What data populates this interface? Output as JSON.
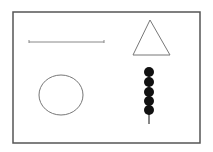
{
  "canvas": {
    "width": 213,
    "height": 152,
    "background": "#ffffff"
  },
  "frame": {
    "x": 13,
    "y": 12,
    "width": 187,
    "height": 131,
    "stroke": "#555555",
    "stroke_width": 1.5
  },
  "shapes": {
    "line": {
      "x1": 29,
      "y1": 42,
      "x2": 104,
      "y2": 42,
      "tick_height": 3,
      "stroke": "#888888"
    },
    "triangle": {
      "points": "143,20 133,55 170,55",
      "stroke": "#777777"
    },
    "circle": {
      "cx": 61,
      "cy": 95,
      "rx": 22,
      "ry": 20,
      "stroke": "#777777"
    },
    "beads": {
      "cx": 149,
      "cys": [
        72,
        82,
        92,
        101,
        110
      ],
      "r": 5,
      "fill": "#111111",
      "stick_bottom": 124
    }
  }
}
